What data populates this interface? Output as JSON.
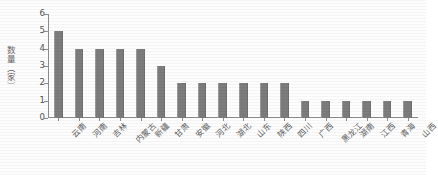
{
  "chart_data": {
    "type": "bar",
    "title": "",
    "subtitle": "",
    "xlabel": "",
    "ylabel": "数量（家）",
    "ylim": [
      0,
      6
    ],
    "yticks": [
      0,
      1,
      2,
      3,
      4,
      5,
      6
    ],
    "ytick_labels": [
      "0",
      "1",
      "2",
      "3",
      "4",
      "5",
      "6"
    ],
    "grid": false,
    "legend": null,
    "bar_color": "#7c7c7c",
    "background_color": "#ffffff",
    "axis_color": "#8d8d8d",
    "categories": [
      "云南",
      "河南",
      "吉林",
      "内蒙古",
      "新疆",
      "甘肃",
      "安徽",
      "河北",
      "湖北",
      "山东",
      "陕西",
      "四川",
      "广西",
      "黑龙江",
      "湖南",
      "江西",
      "青海",
      "山西"
    ],
    "values": [
      5,
      4,
      4,
      4,
      4,
      3,
      2,
      2,
      2,
      2,
      2,
      2,
      1,
      1,
      1,
      1,
      1,
      1
    ]
  },
  "axis": {
    "y_title": "数量（家）"
  }
}
